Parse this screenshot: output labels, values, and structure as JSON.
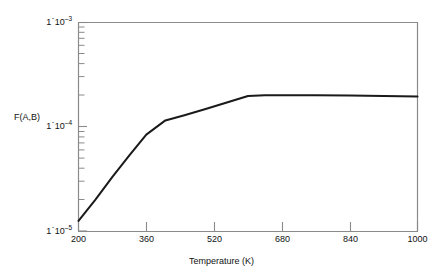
{
  "chart_data": {
    "type": "line",
    "title": "",
    "xlabel": "Temperature (K)",
    "ylabel": "F(A,B)",
    "xscale": "linear",
    "yscale": "log",
    "xlim": [
      200,
      1000
    ],
    "ylim": [
      1e-05,
      0.001
    ],
    "grid": false,
    "legend": null,
    "x_ticks": [
      200,
      360,
      520,
      680,
      840,
      1000
    ],
    "x_tick_labels": [
      "200",
      "360",
      "520",
      "680",
      "840",
      "1000"
    ],
    "y_ticks": [
      1e-05,
      0.0001,
      0.001
    ],
    "y_tick_labels": [
      "1·10−5",
      "1·10−4",
      "1·10−3"
    ],
    "y_minor_ticks": true,
    "series": [
      {
        "name": "F(A,B)",
        "color": "#1a1a1a",
        "linewidth": 2,
        "x": [
          200,
          240,
          280,
          320,
          360,
          405,
          450,
          500,
          550,
          600,
          640,
          700,
          760,
          840,
          920,
          1000
        ],
        "y": [
          1.25e-05,
          2e-05,
          3.3e-05,
          5.3e-05,
          8.4e-05,
          0.000115,
          0.000129,
          0.000148,
          0.000171,
          0.000197,
          0.000201,
          0.000201,
          0.0002,
          0.000199,
          0.000197,
          0.000195
        ]
      }
    ],
    "annotations": []
  },
  "axis": {
    "y_label_top": "1",
    "y_label_top_exp": "–3",
    "y_label_mid": "1",
    "y_label_mid_exp": "–4",
    "y_label_bot": "1",
    "y_label_bot_exp": "–5",
    "y_title": "F(A,B)",
    "x_title": "Temperature (K)",
    "x_labels": [
      "200",
      "360",
      "520",
      "680",
      "840",
      "1000"
    ]
  },
  "style": {
    "frame_color": "#8a8a8a",
    "line_color": "#1a1a1a",
    "text_color": "#111111",
    "background": "#ffffff"
  }
}
